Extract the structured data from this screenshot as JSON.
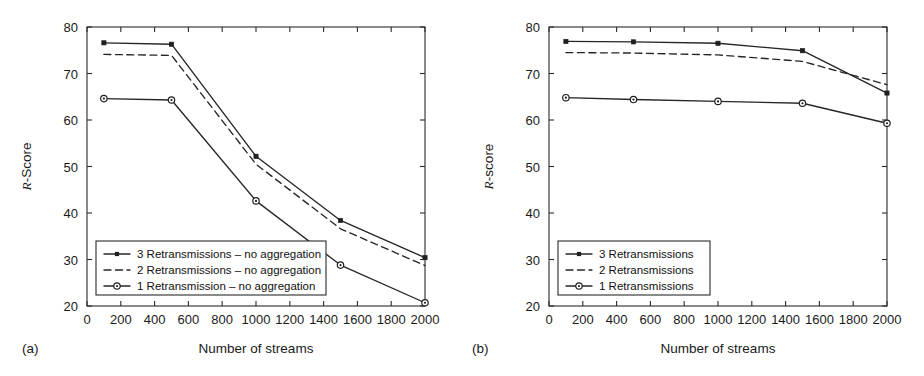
{
  "figure": {
    "background": "#ffffff",
    "line_color": "#262626",
    "axis_color": "#2b2b2b"
  },
  "panels": [
    {
      "tag": "(a)",
      "ylabel_italic": "R",
      "ylabel_rest": "-Score",
      "xlabel": "Number of streams"
    },
    {
      "tag": "(b)",
      "ylabel_italic": "R",
      "ylabel_rest": "-score",
      "xlabel": "Number of streams"
    }
  ],
  "chart_data": [
    {
      "type": "line",
      "panel": "(a)",
      "title": "",
      "xlabel": "Number of streams",
      "ylabel": "R-Score",
      "xlim": [
        0,
        2000
      ],
      "ylim": [
        20,
        80
      ],
      "xticks": [
        0,
        200,
        400,
        600,
        800,
        1000,
        1200,
        1400,
        1600,
        1800,
        2000
      ],
      "xtick_labels": [
        "0",
        "200",
        "400",
        "600",
        "800",
        "1000",
        "1200",
        "1400",
        "1600",
        "1800",
        "2000"
      ],
      "yticks": [
        20,
        30,
        40,
        50,
        60,
        70,
        80
      ],
      "ytick_labels": [
        "20",
        "30",
        "40",
        "50",
        "60",
        "70",
        "80"
      ],
      "grid": false,
      "legend_position": "lower-left",
      "x": [
        100,
        500,
        1000,
        1500,
        2000
      ],
      "series": [
        {
          "name": "3 Retransmissions – no aggregation",
          "values": [
            76.6,
            76.3,
            52.2,
            38.4,
            30.4
          ],
          "style": "solid",
          "marker": "star"
        },
        {
          "name": "2 Retransmissions – no aggregation",
          "values": [
            74.1,
            73.9,
            50.5,
            36.6,
            28.7
          ],
          "style": "dashed",
          "marker": "none"
        },
        {
          "name": "1 Retransmission – no aggregation",
          "values": [
            64.6,
            64.3,
            42.6,
            28.8,
            20.7
          ],
          "style": "solid",
          "marker": "circle"
        }
      ]
    },
    {
      "type": "line",
      "panel": "(b)",
      "title": "",
      "xlabel": "Number of streams",
      "ylabel": "R-score",
      "xlim": [
        0,
        2000
      ],
      "ylim": [
        20,
        80
      ],
      "xticks": [
        0,
        200,
        400,
        600,
        800,
        1000,
        1200,
        1400,
        1600,
        1800,
        2000
      ],
      "xtick_labels": [
        "0",
        "200",
        "400",
        "600",
        "800",
        "1000",
        "1200",
        "1400",
        "1600",
        "1800",
        "2000"
      ],
      "yticks": [
        20,
        30,
        40,
        50,
        60,
        70,
        80
      ],
      "ytick_labels": [
        "20",
        "30",
        "40",
        "50",
        "60",
        "70",
        "80"
      ],
      "grid": false,
      "legend_position": "lower-left",
      "x": [
        100,
        500,
        1000,
        1500,
        2000
      ],
      "series": [
        {
          "name": "3 Retransmissions",
          "values": [
            76.9,
            76.8,
            76.5,
            74.9,
            65.8
          ],
          "style": "solid",
          "marker": "star"
        },
        {
          "name": "2 Retransmissions",
          "values": [
            74.5,
            74.4,
            74.0,
            72.6,
            67.6
          ],
          "style": "dashed",
          "marker": "none"
        },
        {
          "name": "1 Retransmissions",
          "values": [
            64.8,
            64.4,
            64.0,
            63.6,
            59.3
          ],
          "style": "solid",
          "marker": "circle"
        }
      ]
    }
  ]
}
